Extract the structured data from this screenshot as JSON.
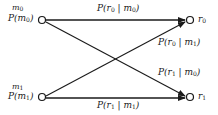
{
  "diagram": {
    "title": "",
    "type": "binary channel transition diagram",
    "colors": {
      "line": "#1a1a1a",
      "background": "#ffffff"
    },
    "inputs": [
      {
        "id": "m0",
        "name": "m",
        "sub": "0",
        "prob_label": "P(m",
        "prob_sub": "0",
        "prob_close": ")"
      },
      {
        "id": "m1",
        "name": "m",
        "sub": "1",
        "prob_label": "P(m",
        "prob_sub": "1",
        "prob_close": ")"
      }
    ],
    "outputs": [
      {
        "id": "r0",
        "name": "r",
        "sub": "0"
      },
      {
        "id": "r1",
        "name": "r",
        "sub": "1"
      }
    ],
    "edges": [
      {
        "from": "m0",
        "to": "r0",
        "label_a": "P(r",
        "sub_a": "0",
        "label_b": " | m",
        "sub_b": "0",
        "close": ")"
      },
      {
        "from": "m1",
        "to": "r0",
        "label_a": "P(r",
        "sub_a": "0",
        "label_b": " | m",
        "sub_b": "1",
        "close": ")"
      },
      {
        "from": "m0",
        "to": "r1",
        "label_a": "P(r",
        "sub_a": "1",
        "label_b": " | m",
        "sub_b": "0",
        "close": ")"
      },
      {
        "from": "m1",
        "to": "r1",
        "label_a": "P(r",
        "sub_a": "1",
        "label_b": " | m",
        "sub_b": "1",
        "close": ")"
      }
    ]
  }
}
